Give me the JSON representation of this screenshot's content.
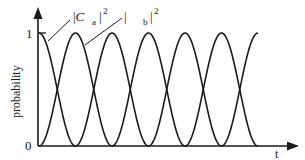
{
  "chart_data": {
    "type": "line",
    "title": "",
    "xlabel": "t",
    "ylabel": "probability",
    "yticks": [
      "0",
      "1"
    ],
    "ylim": [
      0,
      1
    ],
    "grid": false,
    "legend": "inline annotations",
    "annotations": [
      {
        "text_base": "|C",
        "subscript": "a",
        "tail": "|",
        "superscript": "2",
        "series": "|Ca|^2"
      },
      {
        "text_base": "|C",
        "subscript": "b",
        "tail": "|",
        "superscript": "2",
        "series": "|Cb|^2"
      }
    ],
    "series": [
      {
        "name": "|Ca|^2",
        "function": "cos^2(Omega t / 2)",
        "start_value": 1,
        "peaks_at_half_periods": [
          0,
          2,
          4,
          6
        ],
        "zeros_at_half_periods": [
          1,
          3,
          5
        ]
      },
      {
        "name": "|Cb|^2",
        "function": "sin^2(Omega t / 2)",
        "start_value": 0,
        "peaks_at_half_periods": [
          1,
          3,
          5
        ],
        "zeros_at_half_periods": [
          0,
          2,
          4,
          6
        ]
      }
    ],
    "x_half_periods_shown": 6,
    "x": [
      0,
      0.5,
      1,
      1.5,
      2,
      2.5,
      3,
      3.5,
      4,
      4.5,
      5,
      5.5,
      6
    ],
    "values_Ca2": [
      1,
      0.5,
      0,
      0.5,
      1,
      0.5,
      0,
      0.5,
      1,
      0.5,
      0,
      0.5,
      1
    ],
    "values_Cb2": [
      0,
      0.5,
      1,
      0.5,
      0,
      0.5,
      1,
      0.5,
      0,
      0.5,
      1,
      0.5,
      0
    ]
  },
  "labels": {
    "ytick_one": "1",
    "ytick_zero": "0",
    "ylabel": "probability",
    "xlabel": "t",
    "ca_base": "|C",
    "ca_sub": "a",
    "ca_tail": "|",
    "ca_sup": "2",
    "cb_base": "|C",
    "cb_sub": "b",
    "cb_tail": "|",
    "cb_sup": "2"
  }
}
